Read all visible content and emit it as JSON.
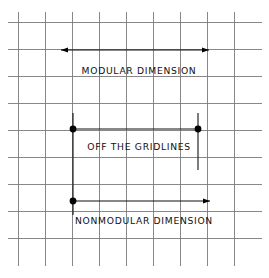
{
  "canvas": {
    "width": 269,
    "height": 278,
    "background": "#ffffff"
  },
  "colors": {
    "grid": "#7b7b7b",
    "dimension": "#111111",
    "dot": "#000000",
    "text": "#111111",
    "background": "#ffffff"
  },
  "grid": {
    "label": "modular planning grid",
    "spacing_px": 27,
    "vertical_x": [
      18,
      45,
      72,
      99,
      126,
      153,
      180,
      207,
      234
    ],
    "horizontal_y": [
      22,
      49,
      76,
      103,
      130,
      157,
      184,
      211,
      238
    ],
    "x_extent": [
      8,
      262
    ],
    "y_extent": [
      12,
      266
    ]
  },
  "dimensions": [
    {
      "id": "modular",
      "label": "MODULAR DIMENSION",
      "label_x": 139,
      "label_y": 74,
      "line_y": 50,
      "x_start": 61,
      "x_end": 209,
      "start_terminator": "arrow",
      "end_terminator": "arrow",
      "extension_lines": []
    },
    {
      "id": "off-the-gridlines",
      "label": "OFF THE GRIDLINES",
      "label_x": 139,
      "label_y": 150,
      "line_y": 129,
      "x_start": 73,
      "x_end": 198,
      "start_terminator": "dot",
      "end_terminator": "dot",
      "extension_lines": [
        {
          "x": 73,
          "y_top": 113,
          "y_bottom": 215
        },
        {
          "x": 198,
          "y_top": 113,
          "y_bottom": 170
        }
      ]
    },
    {
      "id": "nonmodular",
      "label": "NONMODULAR DIMENSION",
      "label_x": 144,
      "label_y": 224,
      "line_y": 201,
      "x_start": 73,
      "x_end": 210,
      "start_terminator": "dot",
      "end_terminator": "arrow",
      "extension_lines": []
    }
  ]
}
